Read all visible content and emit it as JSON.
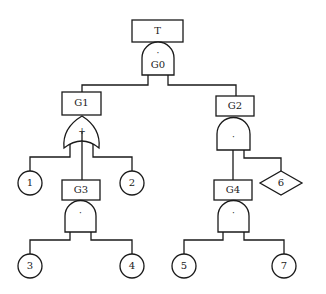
{
  "diagram": {
    "type": "fault-tree",
    "line_color": "#1a1a1a",
    "background": "#ffffff",
    "top_event": {
      "label": "T"
    },
    "gates": [
      {
        "id": "G0",
        "label": "G0",
        "type": "AND",
        "symbol": "·",
        "parent": "T"
      },
      {
        "id": "G1",
        "label": "G1",
        "type": "OR",
        "symbol": "+",
        "parent": "G0"
      },
      {
        "id": "G2",
        "label": "G2",
        "type": "AND",
        "symbol": "·",
        "parent": "G0"
      },
      {
        "id": "G3",
        "label": "G3",
        "type": "AND",
        "symbol": "·",
        "parent": "G1"
      },
      {
        "id": "G4",
        "label": "G4",
        "type": "AND",
        "symbol": "·",
        "parent": "G2"
      }
    ],
    "basic_events": [
      {
        "id": "1",
        "label": "1",
        "shape": "circle",
        "parent": "G1"
      },
      {
        "id": "2",
        "label": "2",
        "shape": "circle",
        "parent": "G1"
      },
      {
        "id": "3",
        "label": "3",
        "shape": "circle",
        "parent": "G3"
      },
      {
        "id": "4",
        "label": "4",
        "shape": "circle",
        "parent": "G3"
      },
      {
        "id": "5",
        "label": "5",
        "shape": "circle",
        "parent": "G4"
      },
      {
        "id": "7",
        "label": "7",
        "shape": "circle",
        "parent": "G4"
      }
    ],
    "undeveloped_events": [
      {
        "id": "6",
        "label": "6",
        "shape": "diamond",
        "parent": "G2"
      }
    ]
  }
}
